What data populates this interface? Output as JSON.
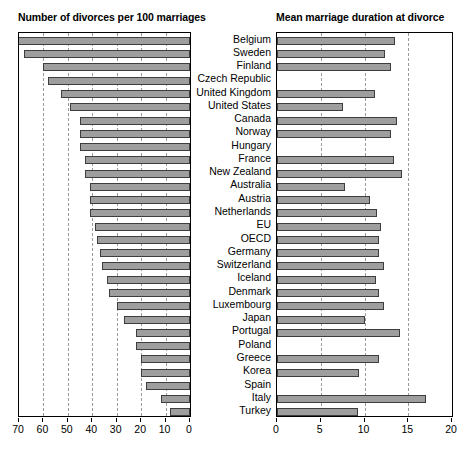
{
  "figure": {
    "left_chart_title": "Number of divorces per 100 marriages",
    "right_chart_title": "Mean marriage duration at divorce"
  },
  "chart_data": [
    {
      "type": "bar",
      "orientation": "horizontal",
      "title": "Number of divorces per 100 marriages",
      "xlabel": "",
      "ylabel": "",
      "xlim": [
        70,
        0
      ],
      "reversed_x_axis": true,
      "xticks": [
        70,
        60,
        50,
        40,
        30,
        20,
        10,
        0
      ],
      "xticklabels": [
        "70",
        "60",
        "50",
        "40",
        "30",
        "20",
        "10",
        "0"
      ],
      "grid": true,
      "grid_axis": "x",
      "legend": false,
      "bar_color": "#9e9e9e",
      "bar_edge_color": "#3d3d3d",
      "categories": [
        "Belgium",
        "Sweden",
        "Finland",
        "Czech Republic",
        "United Kingdom",
        "United States",
        "Canada",
        "Norway",
        "Hungary",
        "France",
        "New Zealand",
        "Australia",
        "Austria",
        "Netherlands",
        "EU",
        "OECD",
        "Germany",
        "Switzerland",
        "Iceland",
        "Denmark",
        "Luxembourg",
        "Japan",
        "Portugal",
        "Poland",
        "Greece",
        "Korea",
        "Spain",
        "Italy",
        "Turkey"
      ],
      "values": [
        71,
        68,
        60,
        58,
        53,
        49,
        45,
        45,
        45,
        43,
        43,
        41,
        41,
        41,
        39,
        38,
        37,
        36,
        34,
        33,
        30,
        27,
        22,
        22,
        20,
        20,
        18,
        12,
        8
      ]
    },
    {
      "type": "bar",
      "orientation": "horizontal",
      "title": "Mean marriage duration at divorce",
      "xlabel": "",
      "ylabel": "",
      "xlim": [
        0,
        20
      ],
      "reversed_x_axis": false,
      "xticks": [
        0,
        5,
        10,
        15,
        20
      ],
      "xticklabels": [
        "0",
        "5",
        "10",
        "15",
        "20"
      ],
      "grid": true,
      "grid_axis": "x",
      "legend": false,
      "bar_color": "#9e9e9e",
      "bar_edge_color": "#3d3d3d",
      "categories": [
        "Belgium",
        "Sweden",
        "Finland",
        "Czech Republic",
        "United Kingdom",
        "United States",
        "Canada",
        "Norway",
        "Hungary",
        "France",
        "New Zealand",
        "Australia",
        "Austria",
        "Netherlands",
        "EU",
        "OECD",
        "Germany",
        "Switzerland",
        "Iceland",
        "Denmark",
        "Luxembourg",
        "Japan",
        "Portugal",
        "Poland",
        "Greece",
        "Korea",
        "Spain",
        "Italy",
        "Turkey"
      ],
      "values": [
        13.5,
        12.3,
        13.0,
        null,
        11.2,
        7.5,
        13.7,
        13.0,
        null,
        13.4,
        14.3,
        7.8,
        10.6,
        11.4,
        11.9,
        11.7,
        11.6,
        12.2,
        11.3,
        11.6,
        12.2,
        10.0,
        14.0,
        null,
        11.7,
        9.4,
        null,
        17.0,
        9.3
      ]
    }
  ]
}
